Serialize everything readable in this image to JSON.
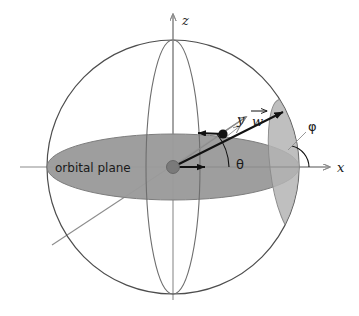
{
  "figure": {
    "background_color": "#ffffff"
  },
  "colors": {
    "sphere_outline": "#4d4d4d",
    "meridian_outline": "#6e6e6e",
    "plane_fill": "#999999",
    "plane_stroke": "#6e6e6e",
    "disc_fill": "#b3b3b3",
    "disc_stroke": "#8c8c8c",
    "axis_gray": "#8c8c8c",
    "vector_black": "#111111",
    "center_dot": "#7a7a7a",
    "satellite_dot": "#111111",
    "text": "#1a1a1a"
  },
  "labels": {
    "z_axis": "z",
    "x_axis": "x",
    "y_axis": "y",
    "theta": "θ",
    "phi": "φ",
    "vector_w": "w",
    "orbital_plane": "orbital plane"
  },
  "geometry": {
    "sphere": {
      "cx": 173,
      "cy": 167,
      "rx": 126,
      "ry": 127
    },
    "orbital_plane_ellipse": {
      "cx": 173,
      "cy": 167,
      "rx": 126,
      "ry": 33
    },
    "vertical_meridian": {
      "cx": 173,
      "cy": 167,
      "rx": 27,
      "ry": 127
    },
    "inclined_disc": {
      "cx": 287,
      "cy": 167,
      "rx": 18,
      "ry": 68,
      "rotation_deg": -8
    },
    "z_axis": {
      "x1": 173,
      "y1": 296,
      "x2": 173,
      "y2": 14
    },
    "x_axis": {
      "x1": 20,
      "y1": 167,
      "x2": 330,
      "y2": 167
    },
    "y_axis": {
      "x1": 52,
      "y1": 245,
      "x2": 246,
      "y2": 117
    },
    "center_dot": {
      "cx": 173,
      "cy": 167,
      "r": 6.5
    },
    "satellite_dot": {
      "cx": 222,
      "cy": 134,
      "r": 4.5
    },
    "radial_vector": {
      "x1": 173,
      "y1": 167,
      "x2": 206,
      "y2": 167
    },
    "w_vector": {
      "x1": 173,
      "y1": 167,
      "x2": 281,
      "y2": 113
    },
    "velocity_arrow": {
      "x1": 222,
      "y1": 134,
      "x2": 196,
      "y2": 133
    },
    "theta_arc": {
      "cx": 173,
      "cy": 167,
      "r": 56
    },
    "phi_arc": {
      "cx": 287,
      "cy": 167,
      "r": 22
    },
    "phi_leader": {
      "x1": 309,
      "y1": 128,
      "x2": 288,
      "y2": 148
    }
  },
  "label_positions": {
    "z": {
      "x": 182,
      "y": 24
    },
    "x": {
      "x": 337,
      "y": 172
    },
    "y": {
      "x": 237,
      "y": 123
    },
    "w": {
      "x": 251,
      "y": 125
    },
    "theta": {
      "x": 236,
      "y": 168
    },
    "phi": {
      "x": 308,
      "y": 130
    },
    "orbital_plane": {
      "x": 55,
      "y": 171
    }
  }
}
